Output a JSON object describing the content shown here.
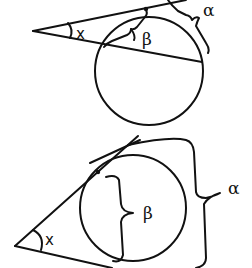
{
  "figure": {
    "colors": {
      "background": "#ffffff",
      "ink": "#111111"
    },
    "diagrams": [
      {
        "id": "tangent-secant",
        "labels": {
          "angle": "x",
          "near_arc": "β",
          "far_arc": "α"
        }
      },
      {
        "id": "two-tangents",
        "labels": {
          "angle": "x",
          "near_arc": "β",
          "far_arc": "α"
        }
      }
    ]
  }
}
